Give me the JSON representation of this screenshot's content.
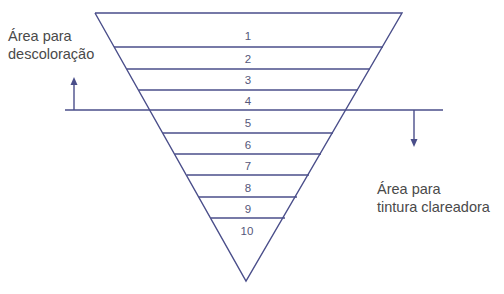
{
  "diagram": {
    "type": "inverted-triangle-levels",
    "levels": [
      "1",
      "2",
      "3",
      "4",
      "5",
      "6",
      "7",
      "8",
      "9",
      "10"
    ],
    "divider_after_level": "4",
    "labels": {
      "top_left": {
        "line1": "Área para",
        "line2": "descoloração",
        "arrow": "up"
      },
      "bottom_right": {
        "line1": "Área para",
        "line2": "tintura clareadora",
        "arrow": "down"
      }
    },
    "colors": {
      "lines": "#4a4e8a",
      "text": "#4a4a4a",
      "numbers": "#55577a"
    }
  }
}
